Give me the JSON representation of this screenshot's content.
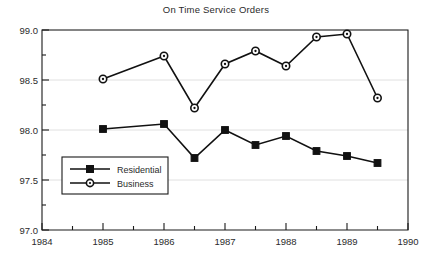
{
  "chart_data": {
    "type": "line",
    "title": "On Time Service Orders",
    "xlabel": "",
    "ylabel": "",
    "xlim": [
      1984,
      1990
    ],
    "ylim": [
      97.0,
      99.0
    ],
    "grid": true,
    "legend_position": "inner-lower-left",
    "x_ticks": [
      "1984",
      "1985",
      "1986",
      "1987",
      "1988",
      "1989",
      "1990"
    ],
    "x_tick_values": [
      1984,
      1985,
      1986,
      1987,
      1988,
      1989,
      1990
    ],
    "x_minor_tick_values": [
      1984.5,
      1985.5,
      1986.5,
      1987.5,
      1988.5,
      1989.5
    ],
    "y_ticks": [
      "97.0",
      "97.5",
      "98.0",
      "98.5",
      "99.0"
    ],
    "y_tick_values": [
      97.0,
      97.5,
      98.0,
      98.5,
      99.0
    ],
    "y_minor_tick_values": [
      97.25,
      97.75,
      98.25,
      98.75
    ],
    "x": [
      1985,
      1985.5,
      1986,
      1986.5,
      1987,
      1987.5,
      1988,
      1988.5,
      1989,
      1989.5
    ],
    "series": [
      {
        "name": "Residential",
        "marker": "square",
        "values": [
          98.01,
          null,
          98.06,
          97.72,
          98.0,
          97.85,
          97.94,
          97.79,
          97.74,
          97.67
        ]
      },
      {
        "name": "Business",
        "marker": "circle",
        "values": [
          98.51,
          null,
          98.74,
          98.22,
          98.66,
          98.79,
          98.64,
          98.93,
          98.96,
          98.32
        ]
      }
    ],
    "colors": {
      "line": "#111111",
      "grid": "#d8d8d8",
      "axis": "#1a1a1a",
      "background": "#ffffff"
    }
  },
  "legend": {
    "items": [
      {
        "label": "Residential",
        "marker": "square"
      },
      {
        "label": "Business",
        "marker": "circle"
      }
    ]
  }
}
